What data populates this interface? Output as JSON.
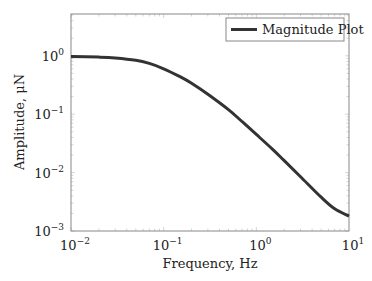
{
  "chart_data": {
    "type": "line",
    "title": "",
    "xlabel": "Frequency, Hz",
    "ylabel": "Amplitude, μN",
    "xscale": "log",
    "yscale": "log",
    "xlim": [
      0.01,
      10
    ],
    "ylim": [
      0.001,
      5
    ],
    "grid": false,
    "legend_position": "upper right",
    "x_ticks": [
      {
        "value": 0.01,
        "base": "10",
        "exp": "−2"
      },
      {
        "value": 0.1,
        "base": "10",
        "exp": "−1"
      },
      {
        "value": 1,
        "base": "10",
        "exp": "0"
      },
      {
        "value": 10,
        "base": "10",
        "exp": "1"
      }
    ],
    "y_ticks": [
      {
        "value": 1,
        "base": "10",
        "exp": "0"
      },
      {
        "value": 0.1,
        "base": "10",
        "exp": "−1"
      },
      {
        "value": 0.01,
        "base": "10",
        "exp": "−2"
      },
      {
        "value": 0.001,
        "base": "10",
        "exp": "−3"
      }
    ],
    "series": [
      {
        "name": "Magnitude Plot",
        "color": "#333333",
        "x": [
          0.01,
          0.02,
          0.03,
          0.05,
          0.07,
          0.1,
          0.15,
          0.2,
          0.3,
          0.5,
          0.7,
          1,
          1.5,
          2,
          3,
          5,
          7,
          10
        ],
        "y": [
          0.97,
          0.95,
          0.92,
          0.84,
          0.74,
          0.6,
          0.44,
          0.34,
          0.22,
          0.12,
          0.075,
          0.045,
          0.025,
          0.016,
          0.0085,
          0.0038,
          0.0024,
          0.0018
        ]
      }
    ]
  },
  "legend": {
    "label": "Magnitude Plot"
  }
}
